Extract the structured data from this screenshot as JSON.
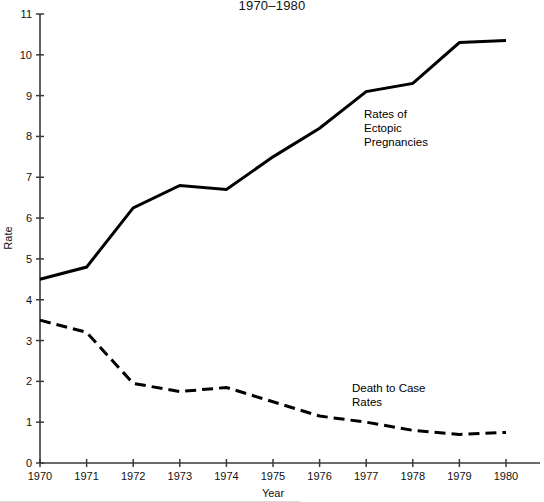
{
  "figure": {
    "title_line": "1970–1980",
    "background": "#ffffff",
    "ink_color": "#000000",
    "axis_color": "#3a3a3a"
  },
  "annotations": [
    {
      "name": "ectopic-label",
      "lines": [
        "Rates of",
        "Ectopic",
        "Pregnancies"
      ],
      "x": 364,
      "y": 118
    },
    {
      "name": "death-to-case-label",
      "lines": [
        "Death to Case",
        "Rates"
      ],
      "x": 352,
      "y": 392
    }
  ],
  "chart_data": {
    "type": "line",
    "title": "1970–1980",
    "xlabel": "Year",
    "ylabel": "Rate",
    "categories": [
      1970,
      1971,
      1972,
      1973,
      1974,
      1975,
      1976,
      1977,
      1978,
      1979,
      1980
    ],
    "x": [
      "1970",
      "1971",
      "1972",
      "1973",
      "1974",
      "1975",
      "1976",
      "1977",
      "1978",
      "1979",
      "1980"
    ],
    "xlim": [
      1970,
      1980
    ],
    "ylim": [
      0,
      11
    ],
    "yticks": [
      0,
      1,
      2,
      3,
      4,
      5,
      6,
      7,
      8,
      9,
      10,
      11
    ],
    "ytick_labels": [
      "0",
      "1",
      "2",
      "3",
      "4",
      "5",
      "6",
      "7",
      "8",
      "9",
      "10",
      "11"
    ],
    "xticks": [
      1970,
      1971,
      1972,
      1973,
      1974,
      1975,
      1976,
      1977,
      1978,
      1979,
      1980
    ],
    "xtick_labels": [
      "1970",
      "1971",
      "1972",
      "1973",
      "1974",
      "1975",
      "1976",
      "1977",
      "1978",
      "1979",
      "1980"
    ],
    "grid": false,
    "legend": "inline-annotations",
    "series": [
      {
        "name": "Rates of Ectopic Pregnancies",
        "style": "solid",
        "color": "#000000",
        "width": 3.0,
        "values": [
          4.5,
          4.8,
          6.25,
          6.8,
          6.7,
          7.5,
          8.2,
          9.1,
          9.3,
          10.3,
          10.35
        ]
      },
      {
        "name": "Death to Case Rates",
        "style": "dashed",
        "color": "#000000",
        "width": 3.0,
        "values": [
          3.5,
          3.2,
          1.95,
          1.75,
          1.85,
          1.5,
          1.15,
          1.0,
          0.8,
          0.7,
          0.75
        ]
      }
    ]
  }
}
